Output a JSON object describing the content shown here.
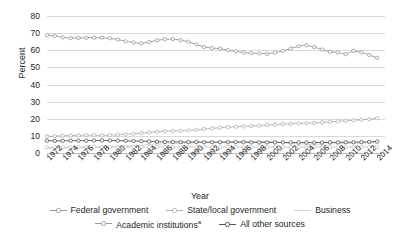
{
  "chart_data": {
    "type": "line",
    "title": "",
    "xlabel": "Year",
    "ylabel": "Percent",
    "ylim": [
      0,
      80
    ],
    "yticks": [
      0,
      10,
      20,
      30,
      40,
      50,
      60,
      70,
      80
    ],
    "xlim": [
      1972,
      2015
    ],
    "xticks": [
      1972,
      1974,
      1976,
      1978,
      1980,
      1982,
      1984,
      1986,
      1988,
      1990,
      1992,
      1994,
      1996,
      1998,
      2000,
      2002,
      2004,
      2006,
      2008,
      2010,
      2012,
      2014
    ],
    "grid": true,
    "legend_position": "bottom",
    "x": [
      1972,
      1973,
      1974,
      1975,
      1976,
      1977,
      1978,
      1979,
      1980,
      1981,
      1982,
      1983,
      1984,
      1985,
      1986,
      1987,
      1988,
      1989,
      1990,
      1991,
      1992,
      1993,
      1994,
      1995,
      1996,
      1997,
      1998,
      1999,
      2000,
      2001,
      2002,
      2003,
      2004,
      2005,
      2006,
      2007,
      2008,
      2009,
      2010,
      2011,
      2012,
      2013,
      2014
    ],
    "series": [
      {
        "name": "Federal government",
        "color": "#8c8c8c",
        "marker": "open-circle",
        "values": [
          68.8,
          68.4,
          67.5,
          67.1,
          67.2,
          67.3,
          67.3,
          67.3,
          67.0,
          66.3,
          65.2,
          64.5,
          64.0,
          64.8,
          65.8,
          66.4,
          66.6,
          65.9,
          65.0,
          63.4,
          61.9,
          61.2,
          61.0,
          60.0,
          59.4,
          58.6,
          58.3,
          58.2,
          57.9,
          58.6,
          59.6,
          61.0,
          62.4,
          62.9,
          61.9,
          60.4,
          59.1,
          58.7,
          57.7,
          59.6,
          58.8,
          57.2,
          55.6
        ]
      },
      {
        "name": "State/local government",
        "color": "#a6a6a6",
        "marker": "open-circle",
        "values": [
          9.7,
          9.8,
          10.1,
          10.2,
          10.3,
          10.4,
          10.4,
          10.2,
          10.4,
          10.7,
          10.9,
          11.2,
          11.6,
          12.0,
          12.4,
          12.7,
          12.8,
          13.0,
          13.2,
          13.5,
          14.0,
          14.4,
          14.8,
          15.1,
          15.3,
          15.5,
          15.8,
          16.0,
          16.3,
          16.6,
          16.9,
          17.1,
          17.2,
          17.4,
          17.6,
          17.9,
          18.2,
          18.5,
          18.8,
          19.1,
          19.4,
          19.7,
          20.3
        ]
      },
      {
        "name": "Business",
        "color": "#d0d0d0",
        "marker": "none",
        "values": [
          2.8,
          2.8,
          2.8,
          2.9,
          3.0,
          3.2,
          3.3,
          3.5,
          3.7,
          4.0,
          4.2,
          4.4,
          4.6,
          5.0,
          5.2,
          5.4,
          5.5,
          5.6,
          5.8,
          6.0,
          6.2,
          6.4,
          6.5,
          6.6,
          6.7,
          6.8,
          6.9,
          6.8,
          6.7,
          6.4,
          6.0,
          5.6,
          5.3,
          5.2,
          5.1,
          5.2,
          5.3,
          5.4,
          5.5,
          5.6,
          5.7,
          5.8,
          6.0
        ]
      },
      {
        "name": "Academic institutions",
        "note": "a",
        "color": "#3f3f3f",
        "marker": "open-circle",
        "values": [
          7.2,
          7.1,
          7.1,
          7.2,
          7.2,
          7.2,
          7.3,
          7.3,
          7.3,
          7.2,
          7.1,
          7.0,
          6.9,
          6.7,
          6.6,
          6.5,
          6.5,
          6.4,
          6.4,
          6.4,
          6.3,
          6.3,
          6.3,
          6.3,
          6.3,
          6.3,
          6.2,
          6.2,
          6.2,
          6.2,
          6.2,
          6.1,
          6.1,
          6.1,
          6.1,
          6.1,
          6.2,
          6.2,
          6.3,
          6.3,
          6.4,
          6.5,
          6.7
        ]
      },
      {
        "name": "All other sources",
        "color": "#bfbfbf",
        "marker": "open-circle",
        "values": [
          3.3,
          3.3,
          3.4,
          3.4,
          3.4,
          3.5,
          3.5,
          3.5,
          3.5,
          3.5,
          3.5,
          3.5,
          3.5,
          3.5,
          3.5,
          3.5,
          3.5,
          3.5,
          3.5,
          3.5,
          3.5,
          3.5,
          3.5,
          3.5,
          3.5,
          3.5,
          3.5,
          3.5,
          3.5,
          3.5,
          3.5,
          3.5,
          3.5,
          3.5,
          3.5,
          3.5,
          3.5,
          3.5,
          3.5,
          3.5,
          3.5,
          3.5,
          3.5
        ]
      }
    ]
  },
  "legend": {
    "rows": [
      [
        {
          "label": "Federal government",
          "sup": "",
          "marker": "open-circle",
          "color": "#8c8c8c"
        },
        {
          "label": "State/local government",
          "sup": "",
          "marker": "open-circle",
          "color": "#a6a6a6"
        },
        {
          "label": "Business",
          "sup": "",
          "marker": "line",
          "color": "#d0d0d0"
        }
      ],
      [
        {
          "label": "Academic institutions",
          "sup": "a",
          "marker": "open-circle",
          "color": "#8c8c8c"
        },
        {
          "label": "All other sources",
          "sup": "",
          "marker": "open-circle",
          "color": "#3f3f3f"
        }
      ]
    ]
  }
}
